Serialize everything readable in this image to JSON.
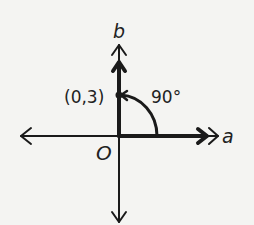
{
  "diagram": {
    "axis_labels": {
      "horizontal": "a",
      "vertical": "b"
    },
    "origin_label": "O",
    "point_label": "(0,3)",
    "angle_label": "90°",
    "colors": {
      "background": "#f4f4f2",
      "ink": "#1a1a1a"
    }
  }
}
